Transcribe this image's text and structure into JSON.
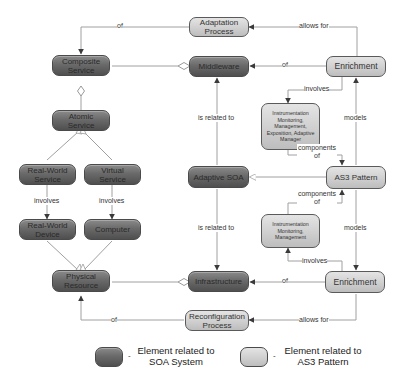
{
  "colors": {
    "soa_element_fill": "#6a6a6a",
    "as3_element_fill": "#cfcfcf",
    "edge": "#9a9a9a",
    "arrowhead": "#3a3a3a",
    "background": "#ffffff"
  },
  "nodes": {
    "adaptation_process": "Adaptation Process",
    "composite_service": "Composite Service",
    "middleware": "Middleware",
    "enrichment_top": "Enrichment",
    "atomic_service": "Atomic Service",
    "instrumentation_top": "Instrumentation Monitoring, Management, Exposition, Adaptive Manager",
    "real_world_service": "Real-World Service",
    "virtual_service": "Virtual Service",
    "adaptive_soa": "Adaptive SOA",
    "as3_pattern": "AS3 Pattern",
    "real_world_device": "Real-World Device",
    "computer": "Computer",
    "instrumentation_bottom": "Instrumentation Monitoring, Management",
    "physical_resource": "Physical Resource",
    "infrastructure": "Infrastructure",
    "enrichment_bottom": "Enrichment",
    "reconfiguration_process": "Reconfiguration Process"
  },
  "edges": {
    "of_adaptation_composite": "of",
    "allows_for_top": "allows for",
    "of_enrichment_middleware": "of",
    "involves_top": "involves",
    "models_top": "models",
    "is_related_to_top": "is related to",
    "components_of_top": "components of",
    "components_of_bottom": "components of",
    "involves_rw": "involves",
    "involves_virtual": "involves",
    "is_related_to_bottom": "is related to",
    "models_bottom": "models",
    "involves_bottom": "involves",
    "of_enrichment_infrastructure": "of",
    "of_reconfig_physical": "of",
    "allows_for_bottom": "allows for"
  },
  "legend": {
    "soa_label": "Element related to SOA System",
    "as3_label": "Element related to AS3 Pattern",
    "separator": "-"
  }
}
